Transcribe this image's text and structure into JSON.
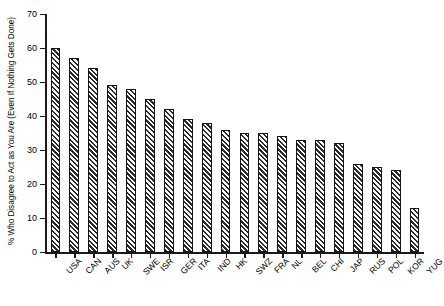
{
  "chart_data": {
    "type": "bar",
    "title": "",
    "subtitle": "",
    "xlabel": "",
    "ylabel": "% Who Disagree to Act as You Are (Even If Nothing Gets Done)",
    "ylim": [
      0,
      70
    ],
    "yticks": [
      0,
      10,
      20,
      30,
      40,
      50,
      60,
      70
    ],
    "ytick_labels": [
      "0",
      "10",
      "20",
      "30",
      "40",
      "50",
      "60",
      "70"
    ],
    "grid": false,
    "legend": null,
    "bar_fill": "diagonal-hatch",
    "bar_edge_color": "#141414",
    "bar_hatch_color": "#2b2b2b",
    "categories": [
      "USA",
      "CAN",
      "AUS",
      "UK",
      "SWE",
      "ISR",
      "GER",
      "ITA",
      "IND",
      "HK",
      "SWZ",
      "FRA",
      "NL",
      "BEL",
      "CHI",
      "JAP",
      "RUS",
      "POL",
      "KOR",
      "YUG"
    ],
    "values": [
      60,
      57,
      54,
      49,
      48,
      45,
      42,
      39,
      38,
      36,
      35,
      35,
      34,
      33,
      33,
      32,
      26,
      25,
      24,
      13
    ]
  }
}
